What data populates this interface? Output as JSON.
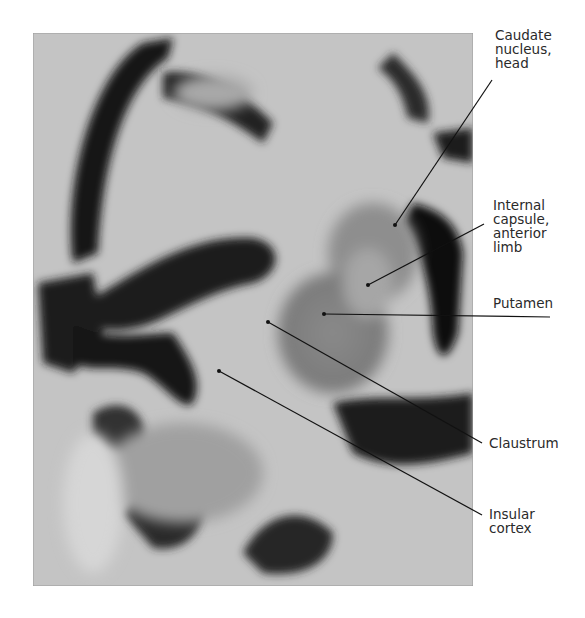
{
  "figure": {
    "labels": [
      {
        "id": "caudate",
        "text": "Caudate\nnucleus,\nhead",
        "x": 495,
        "y": 28,
        "pointer": {
          "x1": 492,
          "y1": 80,
          "x2": 395,
          "y2": 225
        }
      },
      {
        "id": "internal-capsule",
        "text": "Internal\ncapsule,\nanterior\nlimb",
        "x": 493,
        "y": 198,
        "pointer": {
          "x1": 484,
          "y1": 224,
          "x2": 368,
          "y2": 285
        }
      },
      {
        "id": "putamen",
        "text": "Putamen",
        "x": 493,
        "y": 296,
        "pointer": {
          "x1": 324,
          "y1": 314,
          "x2": 550,
          "y2": 317
        }
      },
      {
        "id": "claustrum",
        "text": "Claustrum",
        "x": 489,
        "y": 436,
        "pointer": {
          "x1": 268,
          "y1": 322,
          "x2": 482,
          "y2": 443
        }
      },
      {
        "id": "insular-cortex",
        "text": "Insular\ncortex",
        "x": 489,
        "y": 507,
        "pointer": {
          "x1": 219,
          "y1": 371,
          "x2": 482,
          "y2": 515
        }
      }
    ]
  }
}
